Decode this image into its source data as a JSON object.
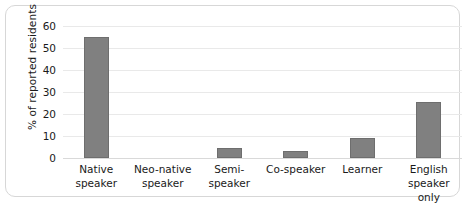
{
  "chart_data": {
    "type": "bar",
    "title": "",
    "xlabel": "",
    "ylabel": "% of reported residents",
    "categories": [
      "Native speaker",
      "Neo-native speaker",
      "Semi-speaker",
      "Co-speaker",
      "Learner",
      "English speaker only"
    ],
    "category_lines": [
      [
        "Native",
        "speaker"
      ],
      [
        "Neo-native",
        "speaker"
      ],
      [
        "Semi-speaker"
      ],
      [
        "Co-speaker"
      ],
      [
        "Learner"
      ],
      [
        "English",
        "speaker only"
      ]
    ],
    "values": [
      55,
      0,
      4.5,
      3,
      9,
      25.5
    ],
    "ylim": [
      0,
      60
    ],
    "yticks": [
      60,
      50,
      40,
      30,
      20,
      10,
      0
    ],
    "ytick_labels": [
      "60",
      "50",
      "40",
      "30",
      "20",
      "10",
      "0"
    ],
    "grid": true,
    "grid_axis": "y",
    "legend": "none",
    "bar_color": "#808080",
    "bar_edge_color": "#6e6e6e",
    "grid_color": "#e9e9e9",
    "text_color": "#1a1a1a",
    "frame_color": "#d7d7d7",
    "background": "#ffffff"
  }
}
